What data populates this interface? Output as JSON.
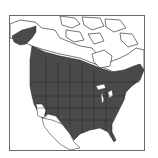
{
  "map": {
    "title": "",
    "subject": "range-map",
    "region": "North America",
    "range_color": "#4a4a4a",
    "land_color": "#ffffff",
    "border_color": "#1a1a1a",
    "frame_color": "#6a6a6a",
    "range_description": "Shaded range covering most of the contiguous United States, southern Canada, and coastal Alaska/British Columbia; absent from northern Canada, the Arctic, southern California/Southwest deserts, Mexico, and southern Florida tip"
  }
}
